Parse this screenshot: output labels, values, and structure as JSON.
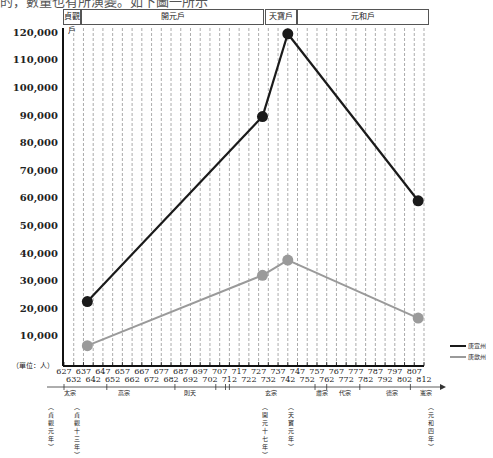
{
  "top_text": "的，數量也有所演變。如下圖一所示",
  "eras": [
    {
      "label": "貞觀戶",
      "x": 63,
      "w": 16
    },
    {
      "label": "開元戶",
      "x": 81,
      "w": 181
    },
    {
      "label": "天寶戶",
      "x": 265,
      "w": 30
    },
    {
      "label": "元和戶",
      "x": 297,
      "w": 130
    }
  ],
  "y_axis": {
    "unit": "（單位：人）",
    "ticks": [
      "120,000",
      "110,000",
      "100,000",
      "90,000",
      "80,000",
      "70,000",
      "60,000",
      "50,000",
      "40,000",
      "30,000",
      "20,000",
      "10,000"
    ]
  },
  "x_axis": {
    "upper": [
      "627",
      "637",
      "647",
      "657",
      "667",
      "677",
      "687",
      "697",
      "707",
      "717",
      "727",
      "737",
      "747",
      "757",
      "767",
      "777",
      "787",
      "797",
      "807"
    ],
    "lower": [
      "632",
      "642",
      "652",
      "662",
      "672",
      "682",
      "692",
      "702",
      "712",
      "722",
      "732",
      "742",
      "752",
      "762",
      "772",
      "782",
      "792",
      "802",
      "812"
    ]
  },
  "reigns": [
    {
      "label": "太宗",
      "x": 64
    },
    {
      "label": "高宗",
      "x": 118
    },
    {
      "label": "則天",
      "x": 184
    },
    {
      "label": "玄宗",
      "x": 265
    },
    {
      "label": "肅宗",
      "x": 316
    },
    {
      "label": "代宗",
      "x": 339
    },
    {
      "label": "德宗",
      "x": 386
    },
    {
      "label": "憲宗",
      "x": 420
    }
  ],
  "year_notes": [
    {
      "label": "（貞觀元年）",
      "x": 47
    },
    {
      "label": "（貞觀十三年）",
      "x": 73
    },
    {
      "label": "（開元十七年）",
      "x": 261
    },
    {
      "label": "（天寶元年）",
      "x": 287
    },
    {
      "label": "（元和四年）",
      "x": 427
    }
  ],
  "legend": [
    {
      "label": "唐宣州",
      "color": "#1a1a1a"
    },
    {
      "label": "唐歙州",
      "color": "#9a9a9a"
    }
  ],
  "chart_data": {
    "type": "line",
    "title": "",
    "xlabel": "年代（唐）",
    "ylabel": "戶數（單位：人）",
    "ylim": [
      0,
      120000
    ],
    "x": [
      639,
      729,
      742,
      809
    ],
    "x_labels": [
      "貞觀十三年",
      "開元十七年",
      "天寶元年",
      "元和四年"
    ],
    "series": [
      {
        "name": "唐宣州",
        "color": "#1a1a1a",
        "values": [
          23000,
          90000,
          120000,
          59500
        ]
      },
      {
        "name": "唐歙州",
        "color": "#9a9a9a",
        "values": [
          7000,
          32500,
          38000,
          17000
        ]
      }
    ],
    "grid": "vertical dashed every 5 years",
    "legend_position": "right-bottom"
  }
}
